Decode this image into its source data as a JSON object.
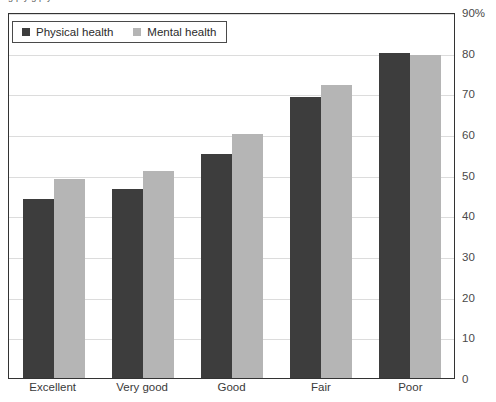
{
  "top_clipped_text": "g p y g p y",
  "legend": {
    "items": [
      {
        "label": "Physical health",
        "color": "#3d3d3d",
        "key": "physical"
      },
      {
        "label": "Mental health",
        "color": "#b5b5b5",
        "key": "mental"
      }
    ]
  },
  "yaxis": {
    "ticks": [
      "90%",
      "80",
      "70",
      "60",
      "50",
      "40",
      "30",
      "20",
      "10",
      "0"
    ]
  },
  "xaxis": {
    "ticks": [
      "Excellent",
      "Very good",
      "Good",
      "Fair",
      "Poor"
    ]
  },
  "chart_data": {
    "type": "bar",
    "title": "",
    "xlabel": "",
    "ylabel": "",
    "ylim": [
      0,
      90
    ],
    "ytick_values": [
      0,
      10,
      20,
      30,
      40,
      50,
      60,
      70,
      80,
      90
    ],
    "ytick_labels": [
      "0",
      "10",
      "20",
      "30",
      "40",
      "50",
      "60",
      "70",
      "80",
      "90%"
    ],
    "grid": true,
    "legend_position": "top-left",
    "categories": [
      "Excellent",
      "Very good",
      "Good",
      "Fair",
      "Poor"
    ],
    "series": [
      {
        "name": "Physical health",
        "color": "#3d3d3d",
        "values": [
          44,
          46.5,
          55,
          69,
          80
        ]
      },
      {
        "name": "Mental health",
        "color": "#b5b5b5",
        "values": [
          49,
          51,
          60,
          72,
          79.5
        ]
      }
    ]
  }
}
